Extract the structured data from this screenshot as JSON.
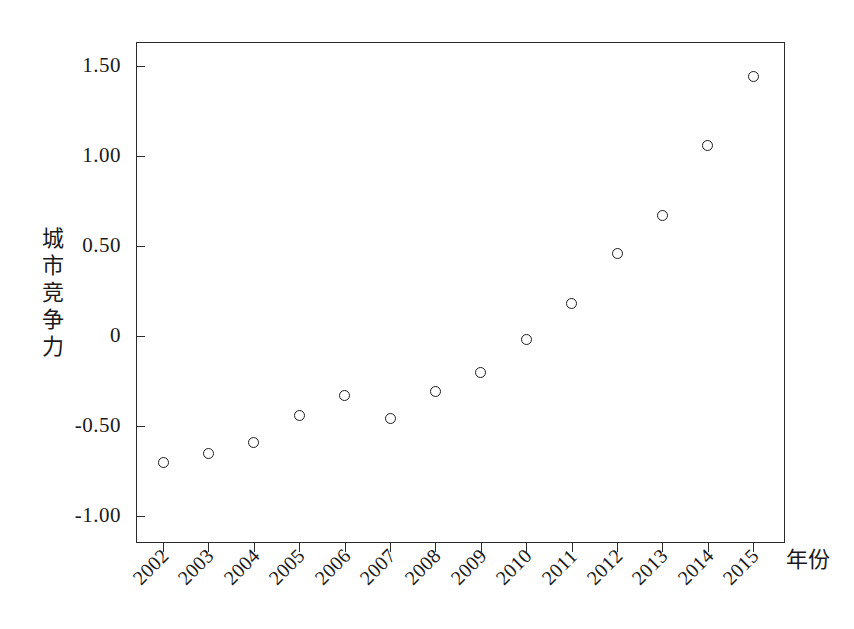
{
  "chart_data": {
    "type": "scatter",
    "title": "",
    "subtitle": "",
    "xlabel": "年份",
    "ylabel": "城市竞争力",
    "ylabel_chars": [
      "城",
      "市",
      "竞",
      "争",
      "力"
    ],
    "categories": [
      "2002",
      "2003",
      "2004",
      "2005",
      "2006",
      "2007",
      "2008",
      "2009",
      "2010",
      "2011",
      "2012",
      "2013",
      "2014",
      "2015"
    ],
    "x": [
      2002,
      2003,
      2004,
      2005,
      2006,
      2007,
      2008,
      2009,
      2010,
      2011,
      2012,
      2013,
      2014,
      2015
    ],
    "values": [
      -0.7,
      -0.65,
      -0.59,
      -0.44,
      -0.33,
      -0.46,
      -0.31,
      -0.2,
      -0.02,
      0.18,
      0.46,
      0.67,
      1.06,
      1.44
    ],
    "series": [
      {
        "name": "城市竞争力",
        "values": [
          -0.7,
          -0.65,
          -0.59,
          -0.44,
          -0.33,
          -0.46,
          -0.31,
          -0.2,
          -0.02,
          0.18,
          0.46,
          0.67,
          1.06,
          1.44
        ]
      }
    ],
    "ytick_labels": [
      "1.50",
      "1.00",
      "0.50",
      "0",
      "-0.50",
      "-1.00"
    ],
    "ytick_values": [
      1.5,
      1.0,
      0.5,
      0,
      -0.5,
      -1.0
    ],
    "ylim": [
      -1.1167,
      1.6333
    ],
    "xlim": [
      2001.5,
      2016.2
    ],
    "grid": false,
    "legend": false,
    "legend_position": "none",
    "marker": "open-circle",
    "marker_color": "#1d1d1d",
    "frame_color": "#2b2b2b",
    "background": "#ffffff",
    "xtick_rotation": -45
  },
  "geometry": {
    "plot_left": 136,
    "plot_top": 42,
    "plot_right": 785,
    "plot_bottom": 543,
    "y_zero_px": 336,
    "y_unit_px": 180,
    "x_first_px": 163,
    "x_step_px": 45.4
  }
}
